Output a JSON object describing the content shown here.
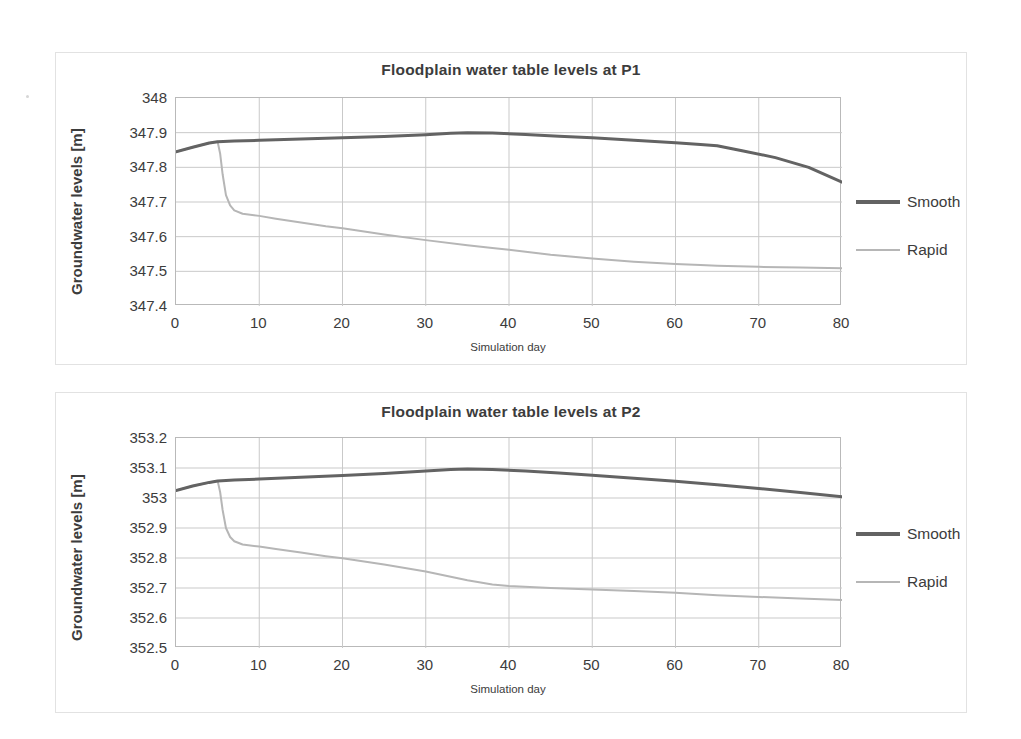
{
  "charts": [
    {
      "id": "P1",
      "title": "Floodplain water table levels at P1",
      "ylabel": "Groundwater levels [m]",
      "xlabel": "Simulation day",
      "yticks": [
        "348",
        "347.9",
        "347.8",
        "347.7",
        "347.6",
        "347.5",
        "347.4"
      ],
      "xticks": [
        "0",
        "10",
        "20",
        "30",
        "40",
        "50",
        "60",
        "70",
        "80"
      ],
      "legend": [
        {
          "label": "Smooth",
          "color": "#636363"
        },
        {
          "label": "Rapid",
          "color": "#b6b6b6"
        }
      ]
    },
    {
      "id": "P2",
      "title": "Floodplain water table levels at P2",
      "ylabel": "Groundwater levels [m]",
      "xlabel": "Simulation day",
      "yticks": [
        "353.2",
        "353.1",
        "353",
        "352.9",
        "352.8",
        "352.7",
        "352.6",
        "352.5"
      ],
      "xticks": [
        "0",
        "10",
        "20",
        "30",
        "40",
        "50",
        "60",
        "70",
        "80"
      ],
      "legend": [
        {
          "label": "Smooth",
          "color": "#636363"
        },
        {
          "label": "Rapid",
          "color": "#b6b6b6"
        }
      ]
    }
  ],
  "chart_data": [
    {
      "type": "line",
      "title": "Floodplain water table levels at P1",
      "xlabel": "Simulation day",
      "ylabel": "Groundwater levels [m]",
      "xlim": [
        0,
        80
      ],
      "ylim": [
        347.4,
        348.0
      ],
      "yticks": [
        347.4,
        347.5,
        347.6,
        347.7,
        347.8,
        347.9,
        348.0
      ],
      "xticks": [
        0,
        10,
        20,
        30,
        40,
        50,
        60,
        70,
        80
      ],
      "grid": true,
      "legend_position": "right",
      "series": [
        {
          "name": "Smooth",
          "color": "#636363",
          "width": 3,
          "x": [
            0,
            2,
            4,
            5,
            7,
            10,
            15,
            20,
            25,
            30,
            33,
            35,
            38,
            42,
            46,
            50,
            55,
            60,
            63,
            65,
            68,
            72,
            76,
            80
          ],
          "y": [
            347.845,
            347.858,
            347.87,
            347.874,
            347.876,
            347.878,
            347.882,
            347.885,
            347.889,
            347.894,
            347.898,
            347.9,
            347.899,
            347.895,
            347.89,
            347.885,
            347.878,
            347.871,
            347.866,
            347.862,
            347.848,
            347.828,
            347.8,
            347.757
          ]
        },
        {
          "name": "Rapid",
          "color": "#b6b6b6",
          "width": 2,
          "x": [
            0,
            2,
            4,
            5,
            5.3,
            5.6,
            6,
            6.5,
            7,
            8,
            10,
            12,
            15,
            18,
            20,
            25,
            30,
            35,
            38,
            40,
            45,
            50,
            55,
            60,
            63,
            65,
            70,
            75,
            80
          ],
          "y": [
            347.845,
            347.858,
            347.87,
            347.874,
            347.84,
            347.78,
            347.72,
            347.69,
            347.676,
            347.666,
            347.66,
            347.652,
            347.641,
            347.63,
            347.624,
            347.606,
            347.59,
            347.575,
            347.567,
            347.562,
            347.548,
            347.537,
            347.528,
            347.521,
            347.518,
            347.516,
            347.513,
            347.511,
            347.509
          ]
        }
      ]
    },
    {
      "type": "line",
      "title": "Floodplain water table levels at P2",
      "xlabel": "Simulation day",
      "ylabel": "Groundwater levels [m]",
      "xlim": [
        0,
        80
      ],
      "ylim": [
        352.5,
        353.2
      ],
      "yticks": [
        352.5,
        352.6,
        352.7,
        352.8,
        352.9,
        353.0,
        353.1,
        353.2
      ],
      "xticks": [
        0,
        10,
        20,
        30,
        40,
        50,
        60,
        70,
        80
      ],
      "grid": true,
      "legend_position": "right",
      "series": [
        {
          "name": "Smooth",
          "color": "#636363",
          "width": 3,
          "x": [
            0,
            2,
            4,
            5,
            7,
            10,
            15,
            20,
            25,
            30,
            33,
            35,
            38,
            42,
            46,
            50,
            55,
            60,
            65,
            70,
            75,
            80
          ],
          "y": [
            353.025,
            353.04,
            353.052,
            353.057,
            353.06,
            353.063,
            353.069,
            353.075,
            353.082,
            353.09,
            353.095,
            353.097,
            353.095,
            353.09,
            353.083,
            353.076,
            353.066,
            353.056,
            353.044,
            353.032,
            353.018,
            353.004
          ]
        },
        {
          "name": "Rapid",
          "color": "#b6b6b6",
          "width": 2,
          "x": [
            0,
            2,
            4,
            5,
            5.3,
            5.6,
            6,
            6.5,
            7,
            8,
            10,
            12,
            15,
            18,
            20,
            25,
            30,
            35,
            38,
            40,
            45,
            50,
            55,
            60,
            65,
            70,
            75,
            80
          ],
          "y": [
            353.025,
            353.04,
            353.052,
            353.057,
            353.02,
            352.96,
            352.9,
            352.87,
            352.856,
            352.845,
            352.838,
            352.83,
            352.818,
            352.806,
            352.799,
            352.778,
            352.755,
            352.726,
            352.712,
            352.707,
            352.7,
            352.695,
            352.69,
            352.684,
            352.676,
            352.67,
            352.665,
            352.66
          ]
        }
      ]
    }
  ]
}
